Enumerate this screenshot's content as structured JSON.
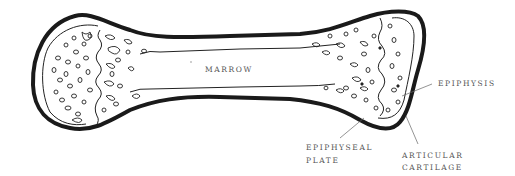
{
  "diagram": {
    "labels": {
      "marrow": "MARROW",
      "epiphysis": "EPIPHYSIS",
      "epiphyseal_plate_line1": "EPIPHYSEAL",
      "epiphyseal_plate_line2": "PLATE",
      "articular_cartilage_line1": "ARTICULAR",
      "articular_cartilage_line2": "CARTILAGE"
    },
    "colors": {
      "outline": "#1a1a1a",
      "label_text": "#555555",
      "background": "#ffffff"
    }
  }
}
